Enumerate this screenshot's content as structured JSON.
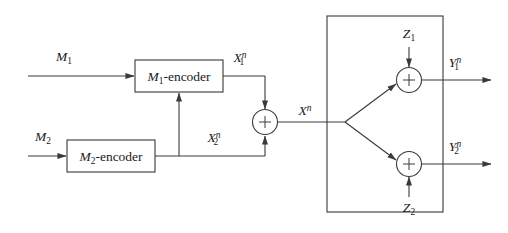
{
  "figure": {
    "type": "block-diagram",
    "background_color": "#ffffff",
    "line_color": "#3a3a3a",
    "text_color": "#1a1a1a"
  },
  "inputs": {
    "m1": {
      "base": "M",
      "sub": "1",
      "sup": ""
    },
    "m2": {
      "base": "M",
      "sub": "2",
      "sup": ""
    }
  },
  "encoders": {
    "enc1": {
      "name": "M",
      "sub": "1",
      "suffix": "-encoder"
    },
    "enc2": {
      "name": "M",
      "sub": "2",
      "suffix": "-encoder"
    }
  },
  "signals": {
    "x1n": {
      "base": "X",
      "sub": "1",
      "sup": "n"
    },
    "x2n": {
      "base": "X",
      "sub": "2",
      "sup": "n"
    },
    "xn": {
      "base": "X",
      "sub": "",
      "sup": "n"
    }
  },
  "noise": {
    "z1": {
      "base": "Z",
      "sub": "1",
      "sup": ""
    },
    "z2": {
      "base": "Z",
      "sub": "2",
      "sup": ""
    }
  },
  "outputs": {
    "y1n": {
      "base": "Y",
      "sub": "1",
      "sup": "n"
    },
    "y2n": {
      "base": "Y",
      "sub": "2",
      "sup": "n"
    }
  },
  "adders": {
    "sum_x": {
      "symbol": "+",
      "name": "combiner-adder"
    },
    "sum_y1": {
      "symbol": "+",
      "name": "channel-1-adder"
    },
    "sum_y2": {
      "symbol": "+",
      "name": "channel-2-adder"
    }
  },
  "channel_block": {
    "label": ""
  }
}
